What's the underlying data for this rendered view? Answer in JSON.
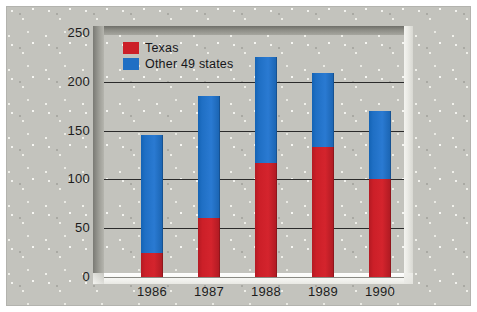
{
  "chart_data": {
    "type": "bar",
    "subtype": "stacked-bar",
    "title": "",
    "xlabel": "",
    "ylabel": "",
    "categories": [
      "1986",
      "1987",
      "1988",
      "1989",
      "1990"
    ],
    "series": [
      {
        "name": "Texas",
        "color": "#cc1f28",
        "values": [
          25,
          60,
          117,
          133,
          100
        ]
      },
      {
        "name": "Other 49 states",
        "color": "#1f6fc4",
        "values": [
          120,
          125,
          108,
          76,
          70
        ]
      }
    ],
    "totals": [
      145,
      185,
      225,
      209,
      170
    ],
    "ylim": [
      0,
      250
    ],
    "yticks": [
      0,
      50,
      100,
      150,
      200,
      250
    ],
    "ytick_labels": [
      "0",
      "50",
      "100",
      "150",
      "200",
      "250"
    ],
    "grid": "horizontal",
    "legend_position": "top-left",
    "legend": [
      {
        "label": "Texas",
        "color": "#cc1f28"
      },
      {
        "label": "Other 49 states",
        "color": "#1f6fc4"
      }
    ]
  },
  "figure": {
    "background_color": "#c3c3bd",
    "plot_frame_style": "recessed-3d-bevel"
  }
}
